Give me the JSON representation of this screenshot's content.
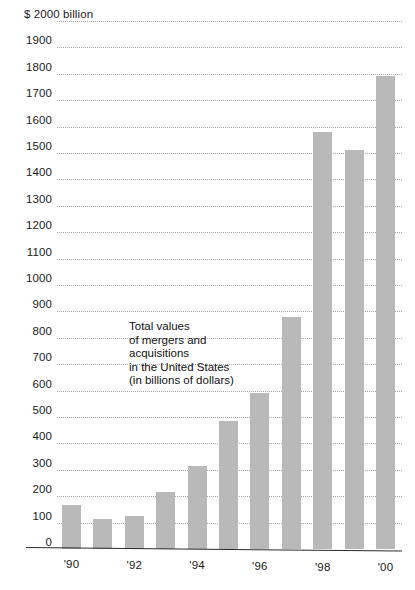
{
  "chart_data": {
    "type": "bar",
    "title": "",
    "subtitle": "",
    "xlabel": "",
    "ylabel": "$ 2000 billion",
    "ylim": [
      0,
      2000
    ],
    "grid": true,
    "legend": "none",
    "units": "billions of dollars",
    "annotation": {
      "lines": [
        "Total values",
        "of mergers and",
        "acquisitions",
        "in the United States",
        "(in billions of dollars)"
      ]
    },
    "y_axis": {
      "top_label": "$ 2000 billion",
      "ticks": [
        {
          "value": 2000,
          "label": "$ 2000 billion"
        },
        {
          "value": 1900,
          "label": "1900"
        },
        {
          "value": 1800,
          "label": "1800"
        },
        {
          "value": 1700,
          "label": "1700"
        },
        {
          "value": 1600,
          "label": "1600"
        },
        {
          "value": 1500,
          "label": "1500"
        },
        {
          "value": 1400,
          "label": "1400"
        },
        {
          "value": 1300,
          "label": "1300"
        },
        {
          "value": 1200,
          "label": "1200"
        },
        {
          "value": 1100,
          "label": "1100"
        },
        {
          "value": 1000,
          "label": "1000"
        },
        {
          "value": 900,
          "label": "900"
        },
        {
          "value": 800,
          "label": "800"
        },
        {
          "value": 700,
          "label": "700"
        },
        {
          "value": 600,
          "label": "600"
        },
        {
          "value": 500,
          "label": "500"
        },
        {
          "value": 400,
          "label": "400"
        },
        {
          "value": 300,
          "label": "300"
        },
        {
          "value": 200,
          "label": "200"
        },
        {
          "value": 100,
          "label": "100"
        },
        {
          "value": 0,
          "label": "0"
        }
      ]
    },
    "x_axis": {
      "tick_labels": [
        "'90",
        "'92",
        "'94",
        "'96",
        "'98",
        "'00"
      ],
      "tick_categories": [
        "1990",
        "1992",
        "1994",
        "1996",
        "1998",
        "2000"
      ]
    },
    "categories": [
      "1990",
      "1991",
      "1992",
      "1993",
      "1994",
      "1995",
      "1996",
      "1997",
      "1998",
      "1999",
      "2000"
    ],
    "category_labels": [
      "'90",
      "'91",
      "'92",
      "'93",
      "'94",
      "'95",
      "'96",
      "'97",
      "'98",
      "'99",
      "'00"
    ],
    "values": [
      165,
      115,
      125,
      215,
      315,
      485,
      590,
      880,
      1580,
      1510,
      1790
    ],
    "series": [
      {
        "name": "Total value of mergers and acquisitions in the United States",
        "values": [
          165,
          115,
          125,
          215,
          315,
          485,
          590,
          880,
          1580,
          1510,
          1790
        ]
      }
    ],
    "colors": {
      "bar": "#b9b9b9",
      "gridline": "#9a9a9a",
      "axis": "#2b2b2b",
      "text": "#1a1a1a",
      "background": "#ffffff"
    }
  }
}
